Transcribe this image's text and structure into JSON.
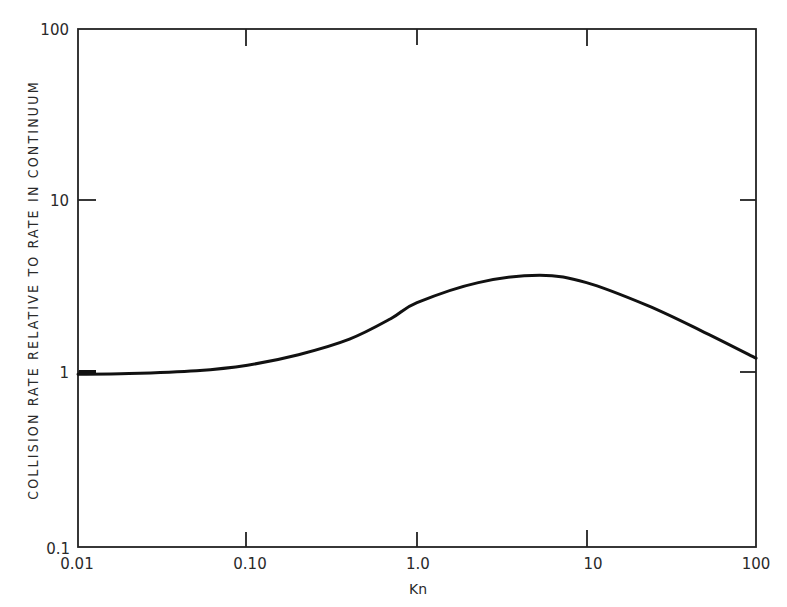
{
  "chart_data": {
    "type": "line",
    "title": "",
    "xlabel": "Kn",
    "ylabel": "COLLISION RATE RELATIVE TO RATE IN CONTINUUM",
    "xscale": "log",
    "yscale": "log",
    "xlim": [
      0.01,
      100
    ],
    "ylim": [
      0.1,
      100
    ],
    "grid": false,
    "legend": null,
    "x_ticks": [
      "0.01",
      "0.10",
      "1.0",
      "10",
      "100"
    ],
    "y_ticks": [
      "0.1",
      "1",
      "10",
      "100"
    ],
    "series": [
      {
        "name": "collision rate ratio",
        "x": [
          0.01,
          0.02,
          0.05,
          0.1,
          0.2,
          0.4,
          0.7,
          1.0,
          2.3,
          5.3,
          10,
          23,
          47,
          100
        ],
        "y": [
          1.0,
          1.01,
          1.05,
          1.13,
          1.3,
          1.6,
          2.1,
          2.6,
          3.4,
          3.75,
          3.4,
          2.5,
          1.8,
          1.24
        ]
      }
    ]
  },
  "labels": {
    "xlabel": "Kn",
    "ylabel": "COLLISION RATE RELATIVE TO RATE IN CONTINUUM",
    "x_ticks": [
      "0.01",
      "0.10",
      "1.0",
      "10",
      "100"
    ],
    "y_ticks": [
      "100",
      "10",
      "1",
      "0.1"
    ]
  }
}
